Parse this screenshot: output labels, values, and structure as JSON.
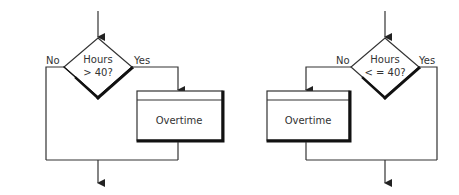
{
  "diagrams": [
    {
      "id": "left",
      "decision": {
        "line1": "Hours",
        "line2": "> 40?"
      },
      "no_label": "No",
      "yes_label": "Yes",
      "process": {
        "label": "Overtime",
        "branch": "yes"
      }
    },
    {
      "id": "right",
      "decision": {
        "line1": "Hours",
        "line2": "< = 40?"
      },
      "no_label": "No",
      "yes_label": "Yes",
      "process": {
        "label": "Overtime",
        "branch": "no"
      }
    }
  ],
  "colors": {
    "line": "#333333",
    "shadow": "#111111",
    "background": "#ffffff"
  }
}
